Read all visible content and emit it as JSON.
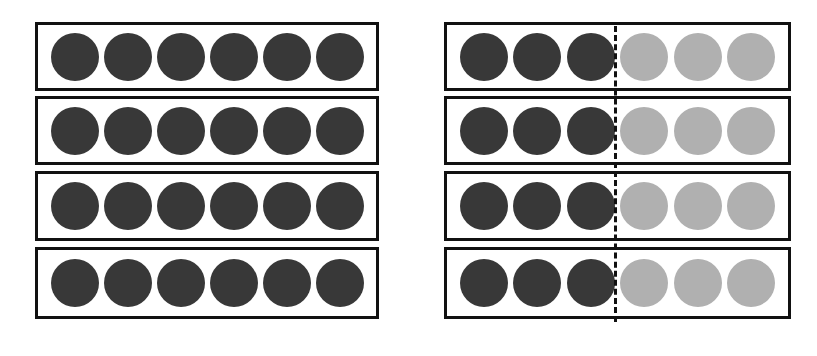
{
  "diagram": {
    "colors": {
      "dark": "#383838",
      "light": "#b0b0b0",
      "border": "#111111"
    },
    "left_group": {
      "rows": [
        [
          "dark",
          "dark",
          "dark",
          "dark",
          "dark",
          "dark"
        ],
        [
          "dark",
          "dark",
          "dark",
          "dark",
          "dark",
          "dark"
        ],
        [
          "dark",
          "dark",
          "dark",
          "dark",
          "dark",
          "dark"
        ],
        [
          "dark",
          "dark",
          "dark",
          "dark",
          "dark",
          "dark"
        ]
      ]
    },
    "right_group": {
      "divider": "dashed vertical line after third circle",
      "rows": [
        [
          "dark",
          "dark",
          "dark",
          "light",
          "light",
          "light"
        ],
        [
          "dark",
          "dark",
          "dark",
          "light",
          "light",
          "light"
        ],
        [
          "dark",
          "dark",
          "dark",
          "light",
          "light",
          "light"
        ],
        [
          "dark",
          "dark",
          "dark",
          "light",
          "light",
          "light"
        ]
      ]
    }
  }
}
